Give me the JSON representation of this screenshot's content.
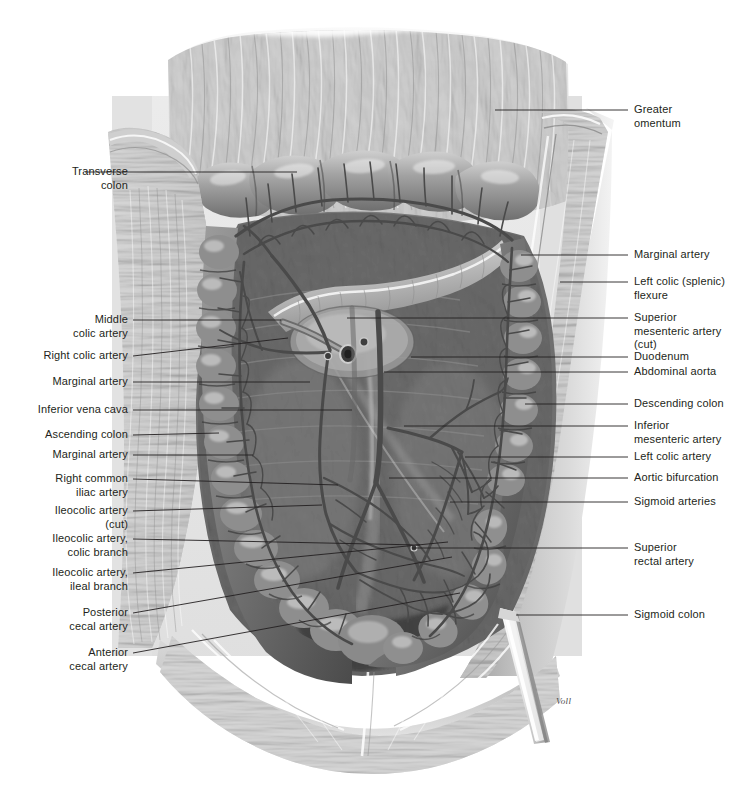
{
  "figure": {
    "signature": "Voll",
    "text_color": "#231f20",
    "leader_color": "#231f20",
    "background": "#ffffff"
  },
  "labels_left": [
    {
      "id": "transverse-colon",
      "text": "Transverse\ncolon",
      "x": 30,
      "y": 165,
      "w": 50,
      "lx1": 85,
      "ly1": 172,
      "lx2": 297,
      "ly2": 172
    },
    {
      "id": "middle-colic-artery",
      "text": "Middle\ncolic artery",
      "x": 55,
      "y": 313,
      "w": 73,
      "lx1": 133,
      "ly1": 320,
      "lx2": 281,
      "ly2": 320
    },
    {
      "id": "right-colic-artery",
      "text": "Right colic artery",
      "x": 26,
      "y": 349,
      "w": 102,
      "lx1": 133,
      "ly1": 356,
      "lx2": 288,
      "ly2": 338
    },
    {
      "id": "marginal-artery-upper",
      "text": "Marginal artery",
      "x": 40,
      "y": 375,
      "w": 88,
      "lx1": 133,
      "ly1": 382,
      "lx2": 310,
      "ly2": 382
    },
    {
      "id": "inferior-vena-cava",
      "text": "Inferior vena cava",
      "x": 19,
      "y": 403,
      "w": 109,
      "lx1": 133,
      "ly1": 410,
      "lx2": 352,
      "ly2": 410
    },
    {
      "id": "ascending-colon",
      "text": "Ascending colon",
      "x": 32,
      "y": 428,
      "w": 96,
      "lx1": 133,
      "ly1": 435,
      "lx2": 219,
      "ly2": 433
    },
    {
      "id": "marginal-artery-lower",
      "text": "Marginal artery",
      "x": 40,
      "y": 448,
      "w": 88,
      "lx1": 133,
      "ly1": 455,
      "lx2": 253,
      "ly2": 455
    },
    {
      "id": "right-common-iliac",
      "text": "Right common\niliac artery",
      "x": 47,
      "y": 472,
      "w": 81,
      "lx1": 133,
      "ly1": 479,
      "lx2": 338,
      "ly2": 485
    },
    {
      "id": "ileocolic-artery-cut",
      "text": "Ileocolic artery\n(cut)",
      "x": 42,
      "y": 504,
      "w": 86,
      "lx1": 133,
      "ly1": 511,
      "lx2": 322,
      "ly2": 505
    },
    {
      "id": "ileocolic-colic-branch",
      "text": "Ileocolic artery,\ncolic branch",
      "x": 35,
      "y": 532,
      "w": 93,
      "lx1": 133,
      "ly1": 539,
      "lx2": 420,
      "ly2": 545
    },
    {
      "id": "ileocolic-ileal-branch",
      "text": "Ileocolic artery,\nileal branch",
      "x": 35,
      "y": 566,
      "w": 93,
      "lx1": 133,
      "ly1": 573,
      "lx2": 448,
      "ly2": 542
    },
    {
      "id": "posterior-cecal-artery",
      "text": "Posterior\ncecal artery",
      "x": 52,
      "y": 606,
      "w": 76,
      "lx1": 133,
      "ly1": 613,
      "lx2": 452,
      "ly2": 557
    },
    {
      "id": "anterior-cecal-artery",
      "text": "Anterior\ncecal artery",
      "x": 52,
      "y": 646,
      "w": 76,
      "lx1": 133,
      "ly1": 653,
      "lx2": 460,
      "ly2": 593
    }
  ],
  "labels_right": [
    {
      "id": "greater-omentum",
      "text": "Greater\nomentum",
      "x": 634,
      "y": 103,
      "lx1": 495,
      "ly1": 110,
      "lx2": 628,
      "ly2": 110
    },
    {
      "id": "marginal-artery-right",
      "text": "Marginal artery",
      "x": 634,
      "y": 248,
      "lx1": 521,
      "ly1": 255,
      "lx2": 628,
      "ly2": 255
    },
    {
      "id": "left-colic-flexure",
      "text": "Left colic (splenic)\nflexure",
      "x": 634,
      "y": 275,
      "lx1": 560,
      "ly1": 282,
      "lx2": 628,
      "ly2": 282
    },
    {
      "id": "superior-mesenteric-cut",
      "text": "Superior\nmesenteric artery\n(cut)",
      "x": 634,
      "y": 311,
      "lx1": 347,
      "ly1": 318,
      "lx2": 628,
      "ly2": 318
    },
    {
      "id": "duodenum",
      "text": "Duodenum",
      "x": 634,
      "y": 350,
      "lx1": 411,
      "ly1": 357,
      "lx2": 628,
      "ly2": 357
    },
    {
      "id": "abdominal-aorta",
      "text": "Abdominal aorta",
      "x": 634,
      "y": 365,
      "lx1": 384,
      "ly1": 372,
      "lx2": 628,
      "ly2": 372
    },
    {
      "id": "descending-colon",
      "text": "Descending colon",
      "x": 634,
      "y": 397,
      "lx1": 525,
      "ly1": 404,
      "lx2": 628,
      "ly2": 404
    },
    {
      "id": "inferior-mesenteric",
      "text": "Inferior\nmesenteric artery",
      "x": 634,
      "y": 419,
      "lx1": 404,
      "ly1": 426,
      "lx2": 628,
      "ly2": 426
    },
    {
      "id": "left-colic-artery",
      "text": "Left colic artery",
      "x": 634,
      "y": 450,
      "lx1": 465,
      "ly1": 457,
      "lx2": 628,
      "ly2": 457
    },
    {
      "id": "aortic-bifurcation",
      "text": "Aortic bifurcation",
      "x": 634,
      "y": 471,
      "lx1": 389,
      "ly1": 478,
      "lx2": 628,
      "ly2": 478
    },
    {
      "id": "sigmoid-arteries",
      "text": "Sigmoid arteries",
      "x": 634,
      "y": 495,
      "lx1": 450,
      "ly1": 502,
      "lx2": 628,
      "ly2": 502
    },
    {
      "id": "superior-rectal-artery",
      "text": "Superior\nrectal artery",
      "x": 634,
      "y": 541,
      "lx1": 412,
      "ly1": 548,
      "lx2": 628,
      "ly2": 548
    },
    {
      "id": "sigmoid-colon",
      "text": "Sigmoid colon",
      "x": 634,
      "y": 608,
      "lx1": 516,
      "ly1": 615,
      "lx2": 628,
      "ly2": 615
    }
  ]
}
